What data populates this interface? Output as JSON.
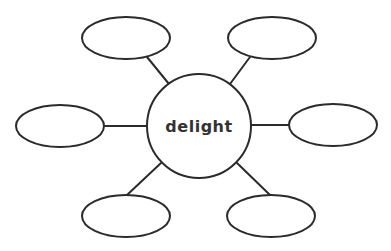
{
  "diagram": {
    "type": "word-web",
    "center": {
      "label": "delight",
      "cx": 199,
      "cy": 126,
      "r": 52
    },
    "nodes": [
      {
        "id": "top-left",
        "label": "",
        "cx": 126,
        "cy": 38,
        "rx": 44,
        "ry": 21,
        "spoke": [
          147,
          57,
          169,
          84
        ]
      },
      {
        "id": "top-right",
        "label": "",
        "cx": 272,
        "cy": 38,
        "rx": 44,
        "ry": 21,
        "spoke": [
          250,
          57,
          230,
          84
        ]
      },
      {
        "id": "left",
        "label": "",
        "cx": 60,
        "cy": 126,
        "rx": 44,
        "ry": 21,
        "spoke": [
          105,
          126,
          147,
          126
        ]
      },
      {
        "id": "right",
        "label": "",
        "cx": 333,
        "cy": 125,
        "rx": 44,
        "ry": 21,
        "spoke": [
          251,
          125,
          289,
          125
        ]
      },
      {
        "id": "bottom-left",
        "label": "",
        "cx": 126,
        "cy": 216,
        "rx": 44,
        "ry": 21,
        "spoke": [
          127,
          195,
          161,
          163
        ]
      },
      {
        "id": "bottom-right",
        "label": "",
        "cx": 271,
        "cy": 216,
        "rx": 44,
        "ry": 21,
        "spoke": [
          270,
          195,
          237,
          163
        ]
      }
    ],
    "colors": {
      "stroke": "#2b2b2b",
      "fill": "#ffffff",
      "text": "#333333"
    }
  }
}
